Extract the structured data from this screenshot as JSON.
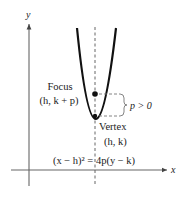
{
  "diagram": {
    "axes": {
      "x_label": "x",
      "y_label": "y"
    },
    "focus": {
      "label": "Focus",
      "coords": "(h, k + p)"
    },
    "vertex": {
      "label": "Vertex",
      "coords": "(h, k)"
    },
    "distance_label": "p > 0",
    "equation": "(x − h)² = 4p(y − k)",
    "colors": {
      "curve": "#111111",
      "axes": "#555555",
      "dashed": "#666666",
      "text": "#222222"
    }
  }
}
